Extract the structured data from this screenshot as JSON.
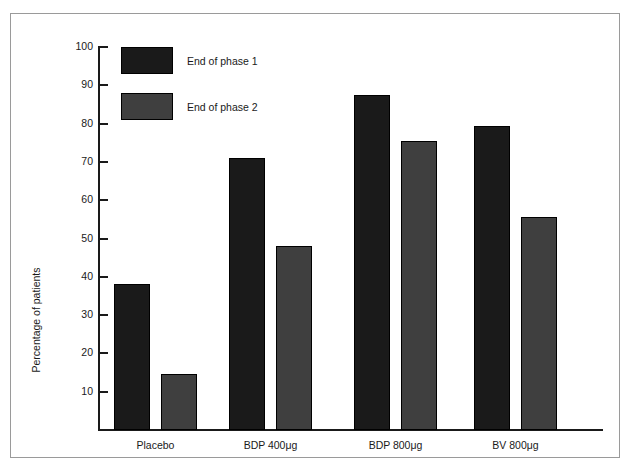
{
  "chart_data": {
    "type": "bar",
    "title": "",
    "xlabel": "",
    "ylabel": "Percentage of patients",
    "categories": [
      "Placebo",
      "BDP 400μg",
      "BDP 800μg",
      "BV 800μg"
    ],
    "series": [
      {
        "name": "End of phase 1",
        "color": "#1a1a1a",
        "values": [
          38,
          71,
          87.5,
          79.5
        ]
      },
      {
        "name": "End of phase 2",
        "color": "#3f3f3f",
        "values": [
          14.5,
          48,
          75.5,
          55.5
        ]
      }
    ],
    "ylim": [
      0,
      100
    ],
    "yticks": [
      100,
      90,
      80,
      70,
      60,
      50,
      40,
      30,
      20,
      10
    ],
    "grid": false,
    "legend_position": "top-left"
  },
  "legend": {
    "items": [
      {
        "label": "End of phase 1"
      },
      {
        "label": "End of phase 2"
      }
    ]
  },
  "axes": {
    "y_title": "Percentage of patients"
  }
}
